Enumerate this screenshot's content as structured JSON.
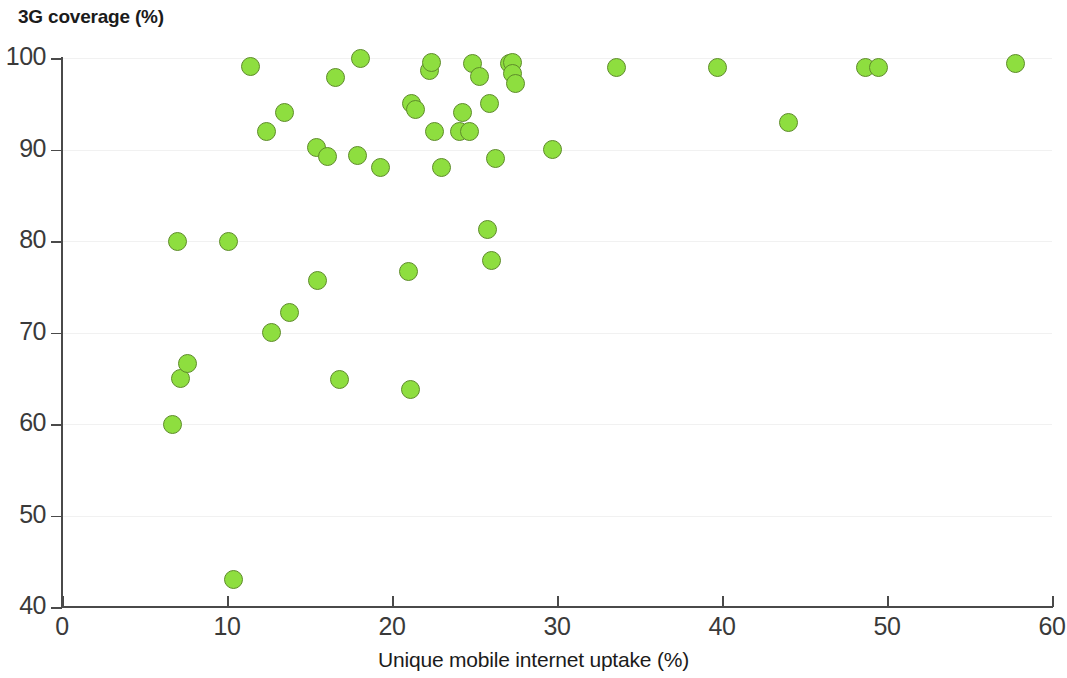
{
  "chart_data": {
    "type": "scatter",
    "title": "3G coverage (%)",
    "xlabel": "Unique mobile internet uptake (%)",
    "ylabel": "3G coverage (%)",
    "xlim": [
      0,
      60
    ],
    "ylim": [
      40,
      100
    ],
    "xticks": [
      0,
      10,
      20,
      30,
      40,
      50,
      60
    ],
    "yticks": [
      40,
      50,
      60,
      70,
      80,
      90,
      100
    ],
    "xtick_labels": [
      "0",
      "10",
      "20",
      "30",
      "40",
      "50",
      "60"
    ],
    "ytick_labels": [
      "40",
      "50",
      "60",
      "70",
      "80",
      "90",
      "100"
    ],
    "grid": "horizontal",
    "legend": "none",
    "marker_color": "#8ede3f",
    "marker_edge_color": "#5e8c2a",
    "axis_color": "#4a4a4a",
    "gridline_color": "#f1f1f1",
    "text_color": "#1b1b1b",
    "points": [
      {
        "x": 6.7,
        "y": 60.0
      },
      {
        "x": 7.0,
        "y": 80.0
      },
      {
        "x": 7.2,
        "y": 65.0
      },
      {
        "x": 7.6,
        "y": 66.6
      },
      {
        "x": 10.1,
        "y": 80.0
      },
      {
        "x": 10.4,
        "y": 43.0
      },
      {
        "x": 11.4,
        "y": 99.1
      },
      {
        "x": 12.4,
        "y": 92.0
      },
      {
        "x": 12.7,
        "y": 70.0
      },
      {
        "x": 13.5,
        "y": 94.0
      },
      {
        "x": 13.8,
        "y": 72.2
      },
      {
        "x": 15.4,
        "y": 90.2
      },
      {
        "x": 15.5,
        "y": 75.7
      },
      {
        "x": 16.1,
        "y": 89.2
      },
      {
        "x": 16.6,
        "y": 97.9
      },
      {
        "x": 16.8,
        "y": 64.9
      },
      {
        "x": 17.9,
        "y": 89.3
      },
      {
        "x": 18.1,
        "y": 100.0
      },
      {
        "x": 19.3,
        "y": 88.0
      },
      {
        "x": 21.0,
        "y": 76.7
      },
      {
        "x": 21.1,
        "y": 63.8
      },
      {
        "x": 21.2,
        "y": 95.0
      },
      {
        "x": 21.4,
        "y": 94.4
      },
      {
        "x": 22.3,
        "y": 98.6
      },
      {
        "x": 22.4,
        "y": 99.5
      },
      {
        "x": 22.6,
        "y": 92.0
      },
      {
        "x": 23.0,
        "y": 88.0
      },
      {
        "x": 24.1,
        "y": 92.0
      },
      {
        "x": 24.3,
        "y": 94.0
      },
      {
        "x": 24.7,
        "y": 92.0
      },
      {
        "x": 24.9,
        "y": 99.4
      },
      {
        "x": 25.3,
        "y": 98.0
      },
      {
        "x": 25.8,
        "y": 81.3
      },
      {
        "x": 25.9,
        "y": 95.0
      },
      {
        "x": 26.0,
        "y": 77.9
      },
      {
        "x": 26.3,
        "y": 89.0
      },
      {
        "x": 27.1,
        "y": 99.4
      },
      {
        "x": 27.3,
        "y": 99.5
      },
      {
        "x": 27.3,
        "y": 98.3
      },
      {
        "x": 27.5,
        "y": 97.2
      },
      {
        "x": 29.7,
        "y": 90.0
      },
      {
        "x": 33.6,
        "y": 99.0
      },
      {
        "x": 39.7,
        "y": 99.0
      },
      {
        "x": 44.0,
        "y": 93.0
      },
      {
        "x": 48.7,
        "y": 99.0
      },
      {
        "x": 49.5,
        "y": 99.0
      },
      {
        "x": 57.8,
        "y": 99.4
      }
    ]
  }
}
